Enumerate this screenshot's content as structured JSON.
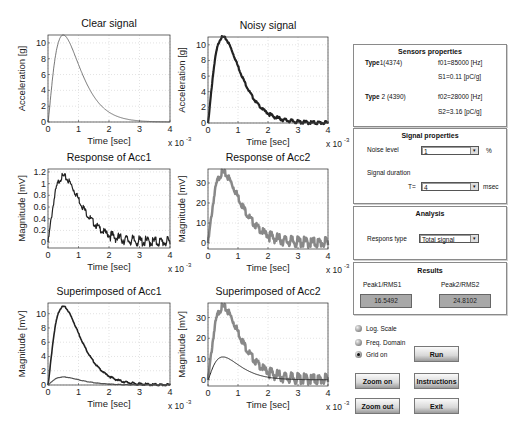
{
  "colors": {
    "line_dark": "#222222",
    "line_mid": "#555555",
    "line_gray": "#888888",
    "grid": "#d0d0d0",
    "panel_border": "#8a8a8a",
    "result_box": "#a8a8a8"
  },
  "plots": [
    {
      "id": "clear",
      "title": "Clear signal",
      "ylabel": "Acceleration [g]",
      "xlabel": "Time [sec]",
      "xexp": "x 10",
      "xexp_pow": "-3",
      "yticks": [
        "0",
        "2",
        "4",
        "6",
        "8",
        "10"
      ],
      "xticks": [
        "0",
        "1",
        "2",
        "3",
        "4"
      ]
    },
    {
      "id": "noisy",
      "title": "Noisy signal",
      "ylabel": "Acceleration [g]",
      "xlabel": "Time [sec]",
      "xexp": "x 10",
      "xexp_pow": "-3",
      "yticks": [
        "0",
        "2",
        "4",
        "6",
        "8",
        "10"
      ],
      "xticks": [
        "0",
        "1",
        "2",
        "3",
        "4"
      ]
    },
    {
      "id": "resp1",
      "title": "Response of Acc1",
      "ylabel": "Magnitude [mV]",
      "xlabel": "Time [sec]",
      "xexp": "x 10",
      "xexp_pow": "-3",
      "yticks": [
        "0",
        "0.2",
        "0.4",
        "0.6",
        "0.8",
        "1",
        "1.2"
      ],
      "xticks": [
        "0",
        "1",
        "2",
        "3",
        "4"
      ]
    },
    {
      "id": "resp2",
      "title": "Response of Acc2",
      "ylabel": "Magnitude [mV]",
      "xlabel": "Time [sec]",
      "xexp": "x 10",
      "xexp_pow": "-3",
      "yticks": [
        "0",
        "10",
        "20",
        "30"
      ],
      "xticks": [
        "0",
        "1",
        "2",
        "3",
        "4"
      ]
    },
    {
      "id": "sup1",
      "title": "Superimposed of Acc1",
      "ylabel": "Magnitude [mV]",
      "xlabel": "Time [sec]",
      "xexp": "x 10",
      "xexp_pow": "-3",
      "yticks": [
        "0",
        "2",
        "4",
        "6",
        "8",
        "10"
      ],
      "xticks": [
        "0",
        "1",
        "2",
        "3",
        "4"
      ]
    },
    {
      "id": "sup2",
      "title": "Superimposed of Acc2",
      "ylabel": "Magnitude [mV]",
      "xlabel": "Time [sec]",
      "xexp": "x 10",
      "xexp_pow": "-3",
      "yticks": [
        "0",
        "10",
        "20",
        "30"
      ],
      "xticks": [
        "0",
        "1",
        "2",
        "3",
        "4"
      ]
    }
  ],
  "sensors": {
    "title": "Sensors properties",
    "type1": {
      "label": "Type",
      "id": "1(4374)",
      "f": "f01=85000 [Hz]",
      "s": "S1=0.11 [pC/g]"
    },
    "type2": {
      "label": "Type",
      "id": " 2 (4390)",
      "f": "f02=28000 [Hz]",
      "s": "S2=3.16 [pC/g]"
    }
  },
  "signal": {
    "title": "Signal properties",
    "noise_label": "Noise level",
    "noise_value": "1",
    "noise_unit": "%",
    "duration_label": "Signal duration",
    "t_label": "T=",
    "t_value": "4",
    "t_unit": "msec"
  },
  "analysis": {
    "title": "Analysis",
    "respons_label": "Respons type",
    "respons_value": "Total signal"
  },
  "results": {
    "title": "Results",
    "label1": "Peak1/RMS1",
    "value1": "16.5492",
    "label2": "Peak2/RMS2",
    "value2": "24.8102"
  },
  "options": {
    "log_scale": "Log. Scale",
    "freq_domain": "Freq. Domain",
    "grid_on": "Grid on"
  },
  "buttons": {
    "run": "Run",
    "zoom_on": "Zoom on",
    "instructions": "Instructions",
    "zoom_out": "Zoom out",
    "exit": "Exit"
  },
  "chart_data": [
    {
      "type": "line",
      "title": "Clear signal",
      "xlabel": "Time [sec] x 10^-3",
      "ylabel": "Acceleration [g]",
      "xlim": [
        0,
        4
      ],
      "ylim": [
        0,
        11
      ],
      "grid": true,
      "series": [
        {
          "name": "clear",
          "x": [
            0,
            0.1,
            0.2,
            0.3,
            0.5,
            0.75,
            1,
            1.5,
            2,
            2.5,
            3,
            3.5,
            4
          ],
          "values": [
            0,
            5.5,
            8.6,
            10.2,
            11,
            10.2,
            8.5,
            5.0,
            2.6,
            1.2,
            0.5,
            0.2,
            0.1
          ]
        }
      ]
    },
    {
      "type": "line",
      "title": "Noisy signal",
      "xlabel": "Time [sec] x 10^-3",
      "ylabel": "Acceleration [g]",
      "xlim": [
        0,
        4
      ],
      "ylim": [
        0,
        11
      ],
      "grid": true,
      "series": [
        {
          "name": "noisy",
          "x": [
            0,
            0.1,
            0.2,
            0.3,
            0.5,
            0.75,
            1,
            1.5,
            2,
            2.5,
            3,
            3.5,
            4
          ],
          "values": [
            0,
            5.5,
            8.6,
            10.2,
            11,
            10.2,
            8.5,
            5.0,
            2.6,
            1.2,
            0.5,
            0.2,
            0.1
          ]
        }
      ]
    },
    {
      "type": "line",
      "title": "Response of Acc1",
      "xlabel": "Time [sec] x 10^-3",
      "ylabel": "Magnitude [mV]",
      "xlim": [
        0,
        4
      ],
      "ylim": [
        -0.1,
        1.25
      ],
      "grid": true,
      "series": [
        {
          "name": "acc1",
          "x": [
            0,
            0.1,
            0.2,
            0.3,
            0.5,
            0.75,
            1,
            1.5,
            2,
            2.5,
            3,
            3.5,
            4
          ],
          "values": [
            0,
            0.6,
            0.9,
            1.05,
            1.12,
            1.0,
            0.85,
            0.55,
            0.28,
            0.12,
            0.05,
            0.03,
            0.02
          ]
        }
      ]
    },
    {
      "type": "line",
      "title": "Response of Acc2",
      "xlabel": "Time [sec] x 10^-3",
      "ylabel": "Magnitude [mV]",
      "xlim": [
        0,
        4
      ],
      "ylim": [
        -3,
        37
      ],
      "grid": true,
      "series": [
        {
          "name": "acc2",
          "x": [
            0,
            0.1,
            0.2,
            0.3,
            0.5,
            0.75,
            1,
            1.5,
            2,
            2.5,
            3,
            3.5,
            4
          ],
          "values": [
            0,
            17,
            27,
            32,
            35,
            32,
            27,
            16,
            8,
            4,
            2,
            1,
            0.5
          ]
        }
      ]
    },
    {
      "type": "line",
      "title": "Superimposed of Acc1",
      "xlabel": "Time [sec] x 10^-3",
      "ylabel": "Magnitude [mV]",
      "xlim": [
        0,
        4
      ],
      "ylim": [
        0,
        11.5
      ],
      "grid": true,
      "series": [
        {
          "name": "input",
          "x": [
            0,
            0.1,
            0.2,
            0.3,
            0.5,
            0.75,
            1,
            1.5,
            2,
            2.5,
            3,
            3.5,
            4
          ],
          "values": [
            0,
            5.5,
            8.6,
            10.2,
            11,
            10.2,
            8.5,
            5.0,
            2.6,
            1.2,
            0.5,
            0.2,
            0.1
          ]
        },
        {
          "name": "acc1",
          "x": [
            0,
            0.1,
            0.2,
            0.3,
            0.5,
            0.75,
            1,
            1.5,
            2,
            2.5,
            3,
            3.5,
            4
          ],
          "values": [
            0,
            0.6,
            0.9,
            1.05,
            1.12,
            1.0,
            0.85,
            0.55,
            0.28,
            0.12,
            0.05,
            0.03,
            0.02
          ]
        }
      ]
    },
    {
      "type": "line",
      "title": "Superimposed of Acc2",
      "xlabel": "Time [sec] x 10^-3",
      "ylabel": "Magnitude [mV]",
      "xlim": [
        0,
        4
      ],
      "ylim": [
        -3,
        37
      ],
      "grid": true,
      "series": [
        {
          "name": "acc2",
          "x": [
            0,
            0.1,
            0.2,
            0.3,
            0.5,
            0.75,
            1,
            1.5,
            2,
            2.5,
            3,
            3.5,
            4
          ],
          "values": [
            0,
            17,
            27,
            32,
            35,
            32,
            27,
            16,
            8,
            4,
            2,
            1,
            0.5
          ]
        },
        {
          "name": "input",
          "x": [
            0,
            0.1,
            0.2,
            0.3,
            0.5,
            0.75,
            1,
            1.5,
            2,
            2.5,
            3,
            3.5,
            4
          ],
          "values": [
            0,
            5.5,
            8.6,
            10.2,
            11,
            10.2,
            8.5,
            5.0,
            2.6,
            1.2,
            0.5,
            0.2,
            0.1
          ]
        }
      ]
    }
  ]
}
